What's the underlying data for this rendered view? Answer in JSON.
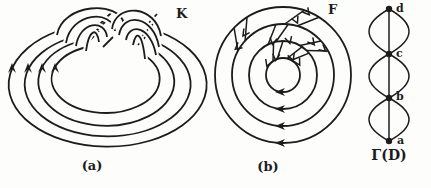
{
  "colors": {
    "background": "#fdfdfc",
    "ink": "#1c1c1c"
  },
  "figure": {
    "panel_a": {
      "caption": "(a)",
      "label": "K",
      "arrow_count": 4,
      "strand_count": 4
    },
    "panel_b": {
      "caption": "(b)",
      "label": "F",
      "circle_count": 4,
      "arrow_count": 4
    },
    "panel_c": {
      "label": "Γ(D)",
      "vertices": [
        "a",
        "b",
        "c",
        "d"
      ],
      "lens_count": 3
    }
  }
}
